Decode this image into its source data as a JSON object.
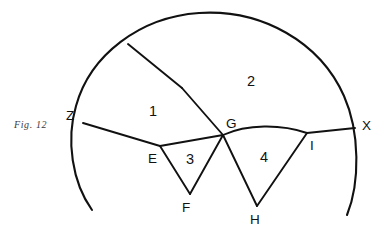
{
  "figure": {
    "caption": "Fig. 12",
    "caption_x": 14,
    "caption_y": 119,
    "width": 390,
    "height": 231,
    "stroke_color": "#111111",
    "background_color": "#ffffff"
  },
  "vertices": [
    {
      "id": "Z",
      "label": "Z",
      "x": 83,
      "y": 123,
      "label_x": 66,
      "label_y": 120
    },
    {
      "id": "X",
      "label": "X",
      "x": 355,
      "y": 128,
      "label_x": 362,
      "label_y": 130
    },
    {
      "id": "G",
      "label": "G",
      "x": 223,
      "y": 135,
      "label_x": 226,
      "label_y": 128
    },
    {
      "id": "E",
      "label": "E",
      "x": 160,
      "y": 146,
      "label_x": 148,
      "label_y": 163
    },
    {
      "id": "F",
      "label": "F",
      "x": 190,
      "y": 194,
      "label_x": 182,
      "label_y": 212
    },
    {
      "id": "H",
      "label": "H",
      "x": 257,
      "y": 206,
      "label_x": 250,
      "label_y": 224
    },
    {
      "id": "I",
      "label": "I",
      "x": 307,
      "y": 133,
      "label_x": 310,
      "label_y": 150
    },
    {
      "id": "T",
      "label": "",
      "x": 128,
      "y": 44,
      "label_x": 0,
      "label_y": 0
    },
    {
      "id": "B",
      "label": "",
      "x": 182,
      "y": 88,
      "label_x": 0,
      "label_y": 0
    }
  ],
  "regions": [
    {
      "id": "r1",
      "label": "1",
      "x": 149,
      "y": 116
    },
    {
      "id": "r2",
      "label": "2",
      "x": 247,
      "y": 86
    },
    {
      "id": "r3",
      "label": "3",
      "x": 186,
      "y": 164
    },
    {
      "id": "r4",
      "label": "4",
      "x": 260,
      "y": 162
    }
  ],
  "paths": {
    "outer_arc": "M 92 210 C 72 182 66 140 76 106 C 90 55 140 17 199 13 C 262 9 320 42 344 96 C 360 132 360 183 347 215",
    "chord_ZE": "M 83 123 L 160 146",
    "chord_EG": "M 160 146 L 223 135",
    "arc_GI": "M 223 135 C 247 124 281 124 307 133",
    "chord_IX": "M 307 133 L 355 128",
    "seg_TB": "M 128 44 L 182 88",
    "seg_BG": "M 182 88 L 223 135",
    "seg_EF": "M 160 146 L 190 194",
    "seg_FG": "M 190 194 L 223 135",
    "seg_GH": "M 223 135 L 257 206",
    "seg_HI": "M 257 206 L 307 133"
  }
}
